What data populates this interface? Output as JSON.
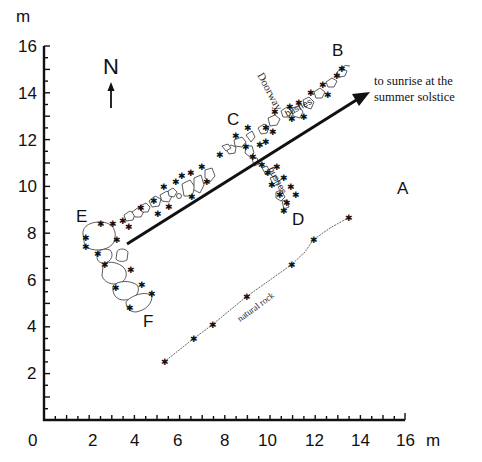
{
  "axes": {
    "unit": "m",
    "x_unit_label": "m",
    "y_unit_label": "m",
    "x_ticks": [
      "0",
      "2",
      "4",
      "6",
      "8",
      "10",
      "12",
      "14",
      "16"
    ],
    "y_ticks": [
      "16",
      "14",
      "12",
      "10",
      "8",
      "6",
      "4",
      "2"
    ],
    "x_range": [
      0,
      16
    ],
    "y_range": [
      0,
      16
    ]
  },
  "north_arrow": {
    "label": "N",
    "icon": "north-arrow-icon"
  },
  "alignment_arrow": {
    "label_line1": "to sunrise at the",
    "label_line2": "summer solstice"
  },
  "labels": {
    "A": "A",
    "B": "B",
    "C": "C",
    "D": "D",
    "E": "E",
    "F": "F",
    "doorway": "Doorway",
    "bushes_1": "bushes",
    "bushes_2": "bushes",
    "natural_rock": "natural rock"
  },
  "colors": {
    "ink": "#111111",
    "background": "#ffffff"
  }
}
